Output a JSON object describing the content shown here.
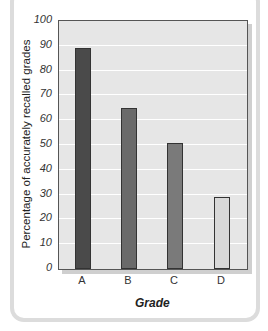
{
  "chart_data": {
    "type": "bar",
    "title": "",
    "categories": [
      "A",
      "B",
      "C",
      "D"
    ],
    "values": [
      89,
      65,
      51,
      29
    ],
    "xlabel": "Grade",
    "ylabel": "Percentage of accurately recalled grades",
    "ylim": [
      0,
      100
    ],
    "yticks": [
      0,
      10,
      20,
      30,
      40,
      50,
      60,
      70,
      80,
      90,
      100
    ],
    "grid": true,
    "legend": null,
    "bar_colors": [
      "#4a4a4a",
      "#6a6a6a",
      "#7a7a7a",
      "#d8d8d8"
    ]
  },
  "axis": {
    "ticks": [
      "0",
      "10",
      "20",
      "30",
      "40",
      "50",
      "60",
      "70",
      "80",
      "90",
      "100"
    ]
  }
}
